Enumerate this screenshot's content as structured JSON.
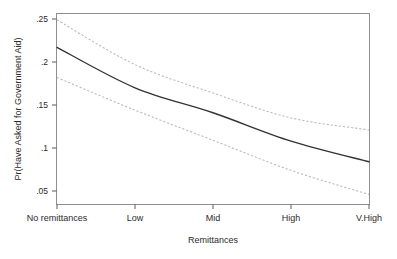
{
  "chart_data": {
    "type": "line",
    "title": "",
    "xlabel": "Remittances",
    "ylabel": "Pr(Have Asked for Government Aid)",
    "categories": [
      "No remittances",
      "Low",
      "Mid",
      "High",
      "V.High"
    ],
    "x": [
      0,
      1,
      2,
      3,
      4
    ],
    "ytick_labels": [
      ".05",
      ".1",
      ".15",
      ".2",
      ".25"
    ],
    "ytick_values": [
      0.05,
      0.1,
      0.15,
      0.2,
      0.25
    ],
    "ylim": [
      0.035,
      0.262
    ],
    "xlim": [
      -0.17,
      4.17
    ],
    "grid": false,
    "legend": null,
    "series": [
      {
        "name": "Upper 95% CI",
        "style": "dashed",
        "color": "#b9b9b9",
        "values": [
          0.249,
          0.197,
          0.164,
          0.135,
          0.121
        ]
      },
      {
        "name": "Predicted probability",
        "style": "solid",
        "color": "#333333",
        "values": [
          0.217,
          0.17,
          0.141,
          0.108,
          0.084
        ]
      },
      {
        "name": "Lower 95% CI",
        "style": "dashed",
        "color": "#b9b9b9",
        "values": [
          0.182,
          0.144,
          0.109,
          0.074,
          0.046
        ]
      }
    ]
  },
  "axes": {
    "y_title": "Pr(Have Asked for Government Aid)",
    "x_title": "Remittances",
    "y_ticks": [
      {
        "label": ".25"
      },
      {
        "label": ".2"
      },
      {
        "label": ".15"
      },
      {
        "label": ".1"
      },
      {
        "label": ".05"
      }
    ],
    "x_ticks": [
      {
        "label": "No remittances"
      },
      {
        "label": "Low"
      },
      {
        "label": "Mid"
      },
      {
        "label": "High"
      },
      {
        "label": "V.High"
      }
    ]
  }
}
